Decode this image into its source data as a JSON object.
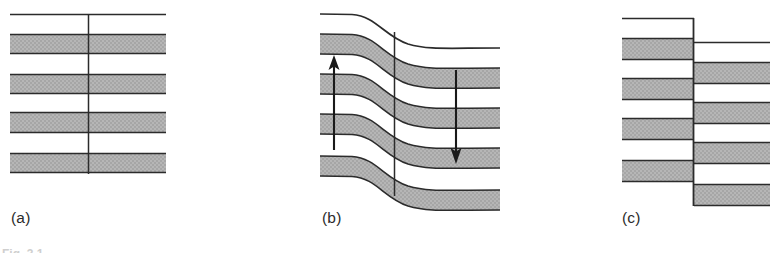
{
  "figure": {
    "kind": "geological-cross-section-diagram",
    "panel_count": 3,
    "caption_sliver_text": "Fig. 3.1",
    "colors": {
      "strata_fill": "#b3b3b3",
      "strata_outline": "#2b2b2b",
      "arrow": "#1a1a1a",
      "background": "#ffffff",
      "label_text": "#2b2b2b"
    }
  },
  "panels": [
    {
      "id": "a",
      "label": "(a)",
      "description": "undeformed horizontal strata with vertical reference line",
      "bed_count": 4,
      "top_surface_y": 14,
      "reference_line_x": 88,
      "left_edge_x": 10,
      "right_edge_x": 166,
      "beds": [
        {
          "top": 34,
          "bottom": 54
        },
        {
          "top": 74,
          "bottom": 94
        },
        {
          "top": 112,
          "bottom": 133
        },
        {
          "top": 153,
          "bottom": 173
        }
      ]
    },
    {
      "id": "b",
      "label": "(b)",
      "description": "folded strata, monoclinal flexure, with vertical displacement arrows",
      "bed_count": 4,
      "reference_line_x": 394,
      "left_edge_x": 320,
      "fold_hinge_start_x": 352,
      "fold_hinge_end_x": 424,
      "fold_throw_px": 34,
      "arrows": [
        {
          "name": "uplift-arrow",
          "direction": "up",
          "x": 334,
          "tail_y": 150,
          "head_y": 57
        },
        {
          "name": "downthrow-arrow",
          "direction": "down",
          "x": 456,
          "tail_y": 70,
          "head_y": 162
        }
      ]
    },
    {
      "id": "c",
      "label": "(c)",
      "description": "faulted strata, normal fault with downthrown right-hand block",
      "bed_count": 4,
      "fault_line_x": 693,
      "left_edge_x": 622,
      "fault_offset_px": 24,
      "left_block_beds": [
        {
          "top": 38,
          "bottom": 60
        },
        {
          "top": 78,
          "bottom": 100
        },
        {
          "top": 118,
          "bottom": 140
        },
        {
          "top": 160,
          "bottom": 182
        }
      ]
    }
  ]
}
